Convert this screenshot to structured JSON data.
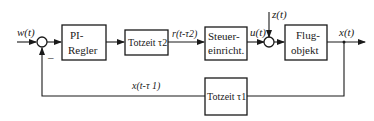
{
  "diagram": {
    "type": "control-loop block diagram",
    "signals": {
      "input": "w(t)",
      "delayed_control": "r(t-τ2)",
      "actuator": "u(t)",
      "disturbance": "z(t)",
      "output": "x(t)",
      "delayed_feedback": "x(t-τ 1)",
      "feedback_sign": "–"
    },
    "blocks": [
      {
        "id": "pi",
        "line1": "PI-",
        "line2": "Regler"
      },
      {
        "id": "tz2",
        "line1": "Totzeit τ2"
      },
      {
        "id": "steuer",
        "line1": "Steuer-",
        "line2": "einricht."
      },
      {
        "id": "flug",
        "line1": "Flug-",
        "line2": "objekt"
      },
      {
        "id": "tz1",
        "line1": "Totzeit τ1"
      }
    ]
  }
}
